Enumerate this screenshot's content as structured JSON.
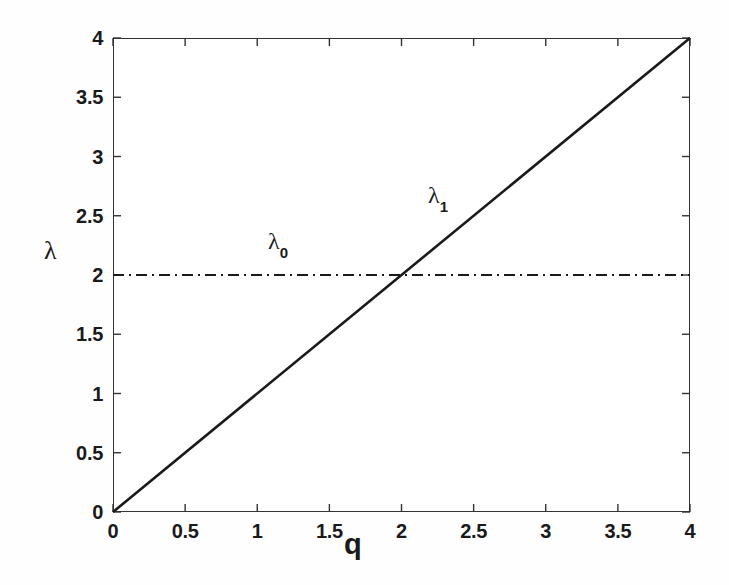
{
  "chart_data": {
    "type": "line",
    "title": "",
    "subtitle": "",
    "xlabel": "q",
    "ylabel": "λ",
    "xlim": [
      0,
      4
    ],
    "ylim": [
      0,
      4
    ],
    "grid": false,
    "legend_position": "inline-annotation",
    "x_ticks": [
      0,
      0.5,
      1,
      1.5,
      2,
      2.5,
      3,
      3.5,
      4
    ],
    "y_ticks": [
      0,
      0.5,
      1,
      1.5,
      2,
      2.5,
      3,
      3.5,
      4
    ],
    "x_tick_labels": [
      "0",
      "0.5",
      "1",
      "1.5",
      "2",
      "2.5",
      "3",
      "3.5",
      "4"
    ],
    "y_tick_labels": [
      "0",
      "0.5",
      "1",
      "1.5",
      "2",
      "2.5",
      "3",
      "3.5",
      "4"
    ],
    "series": [
      {
        "name": "λ0",
        "label_base": "λ",
        "label_sub": "0",
        "style": "dash-dot",
        "color": "#1a1a1a",
        "width": 2,
        "x": [
          0,
          4
        ],
        "values": [
          2,
          2
        ]
      },
      {
        "name": "λ1",
        "label_base": "λ",
        "label_sub": "1",
        "style": "solid",
        "color": "#1a1a1a",
        "width": 2.6,
        "x": [
          0,
          4
        ],
        "values": [
          0,
          4
        ]
      }
    ],
    "annotations": [
      {
        "text": "λ0",
        "base": "λ",
        "sub": "0",
        "x": 1.1,
        "y": 2.25
      },
      {
        "text": "λ1",
        "base": "λ",
        "sub": "1",
        "x": 2.25,
        "y": 2.62
      }
    ],
    "intersection": {
      "x": 2,
      "y": 2
    }
  },
  "axes": {
    "x_title": "q",
    "y_title": "λ",
    "tick_direction": "in",
    "frame_color": "#333333",
    "background": "#ffffff"
  }
}
